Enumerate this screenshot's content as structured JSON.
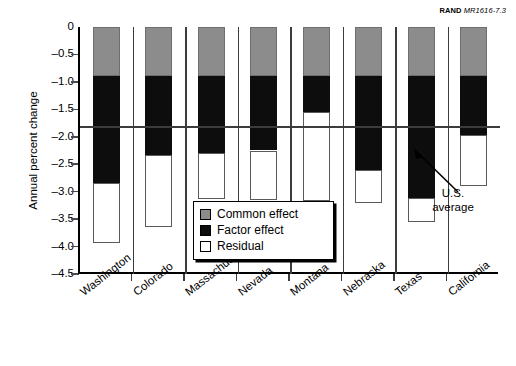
{
  "source_credit": {
    "org": "RAND",
    "doc_number": "MR1616-7.3"
  },
  "axes": {
    "y_title": "Annual percent change",
    "y_ticks": [
      "0",
      "–0.5",
      "–1.0",
      "–1.5",
      "–2.0",
      "–2.5",
      "–3.0",
      "–3.5",
      "–4.0",
      "–4.5"
    ]
  },
  "legend": {
    "items": [
      {
        "label": "Common effect",
        "color": "#8c8c8c"
      },
      {
        "label": "Factor effect",
        "color": "#0d0d0d"
      },
      {
        "label": "Residual",
        "color": "#ffffff"
      }
    ]
  },
  "annotation": {
    "line1": "U.S.",
    "line2": "average",
    "value": -1.82
  },
  "chart_data": {
    "type": "bar",
    "title": "",
    "subtitle": "",
    "xlabel": "",
    "ylabel": "Annual percent change",
    "ylim": [
      -4.5,
      0
    ],
    "grid": false,
    "stacked": true,
    "orientation": "downward",
    "legend_position": "inside-bottom-center",
    "categories": [
      "Washington",
      "Colorado",
      "Massachusetts",
      "Nevada",
      "Montana",
      "Nebraska",
      "Texas",
      "California"
    ],
    "series": [
      {
        "name": "Common effect",
        "color": "#8c8c8c",
        "values": [
          -0.89,
          -0.89,
          -0.89,
          -0.89,
          -0.89,
          -0.89,
          -0.89,
          -0.89
        ]
      },
      {
        "name": "Factor effect",
        "color": "#0d0d0d",
        "values": [
          -1.95,
          -1.44,
          -1.4,
          -1.36,
          -0.66,
          -1.72,
          -2.22,
          -1.08
        ]
      },
      {
        "name": "Residual",
        "color": "#ffffff",
        "values": [
          -1.09,
          -1.32,
          -0.85,
          -0.91,
          -1.62,
          -0.59,
          -0.45,
          -0.93
        ]
      }
    ],
    "cumulative_tops": {
      "common_bottom": [
        -0.89,
        -0.89,
        -0.89,
        -0.89,
        -0.89,
        -0.89,
        -0.89,
        -0.89
      ],
      "factor_bottom": [
        -2.84,
        -2.33,
        -2.29,
        -2.25,
        -1.55,
        -2.61,
        -3.11,
        -1.97
      ],
      "residual_bottom": [
        -3.93,
        -3.65,
        -3.14,
        -3.16,
        -3.17,
        -3.2,
        -3.56,
        -2.9
      ]
    },
    "annotations": [
      {
        "text": "U.S. average",
        "type": "hline",
        "y": -1.82
      }
    ]
  }
}
